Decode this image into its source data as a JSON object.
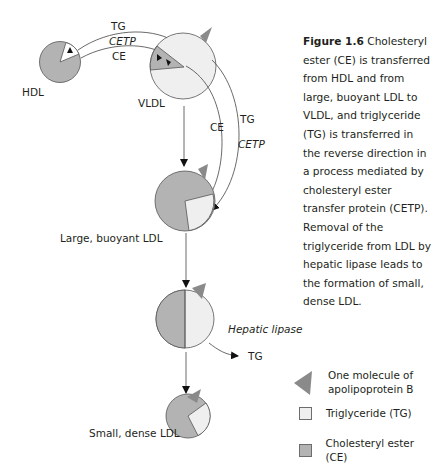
{
  "figure": {
    "number_label": "Figure 1.6",
    "caption": "Cholesteryl ester (CE) is transferred from HDL and from large, buoyant LDL to VLDL, and triglyceride (TG) is transferred in the reverse direction in a process mediated by cholesteryl ester transfer protein (CETP). Removal of the triglyceride from LDL by hepatic lipase leads to the formation of small, dense LDL."
  },
  "particles": [
    {
      "id": "hdl",
      "label": "HDL",
      "composition": "mostly CE with small TG wedge"
    },
    {
      "id": "vldl",
      "label": "VLDL",
      "composition": "mostly TG with CE wedge"
    },
    {
      "id": "large_ldl",
      "label": "Large, buoyant LDL",
      "composition": "mostly CE with TG quarter"
    },
    {
      "id": "intermediate_ldl",
      "label": "",
      "composition": "half CE, half TG"
    },
    {
      "id": "small_ldl",
      "label": "Small, dense LDL",
      "composition": "mostly CE with small TG wedge"
    }
  ],
  "transfers": {
    "hdl_vldl": {
      "top": "TG",
      "middle": "CETP",
      "bottom": "CE"
    },
    "ldl_vldl": {
      "inner": "CE",
      "outer": "TG",
      "enzyme": "CETP"
    },
    "hepatic": {
      "enzyme": "Hepatic lipase",
      "product": "TG"
    }
  },
  "legend": {
    "items": [
      {
        "symbol": "grey-triangle",
        "label_line1": "One molecule of",
        "label_line2": "apolipoprotein B"
      },
      {
        "symbol": "light-square",
        "label": "Triglyceride (TG)"
      },
      {
        "symbol": "grey-square",
        "label": "Cholesteryl ester (CE)"
      }
    ]
  },
  "colors": {
    "ce_fill": "#b3b3b3",
    "tg_fill": "#efefef",
    "apob": "#8a8a8a",
    "stroke": "#4d4d4d",
    "text": "#231f20"
  }
}
